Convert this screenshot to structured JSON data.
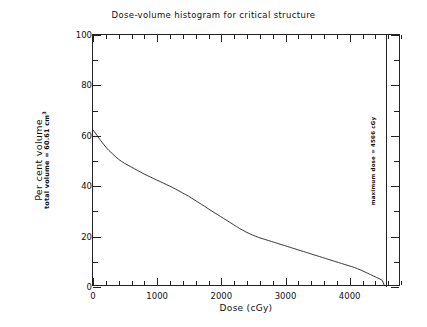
{
  "chart_data": {
    "type": "line",
    "title": "Dose-volume histogram for critical structure",
    "xlabel": "Dose (cGy)",
    "ylabel": "Per cent volume",
    "ylabel_sub": "total volume =  60.61 cm",
    "ylabel_sub_exp": "3",
    "xlim": [
      0,
      4800
    ],
    "ylim": [
      0,
      100
    ],
    "xticks": [
      0,
      1000,
      2000,
      3000,
      4000
    ],
    "xtick_labels": [
      "0",
      "1000",
      "2000",
      "3000",
      "4000"
    ],
    "xtick_minor_step": 200,
    "yticks": [
      0,
      20,
      40,
      60,
      80,
      100
    ],
    "ytick_labels": [
      "0",
      "20",
      "40",
      "60",
      "80",
      "100"
    ],
    "ytick_minor_step": 10,
    "grid": false,
    "legend": "none",
    "line_color": "#222222",
    "annotations": [
      {
        "name": "maximum-dose-line",
        "text": "maximum dose =  4566 cGy",
        "x": 4566,
        "orientation": "vertical"
      }
    ],
    "x": [
      0,
      50,
      100,
      150,
      200,
      250,
      300,
      350,
      400,
      450,
      500,
      550,
      600,
      650,
      700,
      750,
      800,
      850,
      900,
      950,
      1000,
      1050,
      1100,
      1150,
      1200,
      1250,
      1300,
      1350,
      1400,
      1450,
      1500,
      1550,
      1600,
      1650,
      1700,
      1750,
      1800,
      1850,
      1900,
      1950,
      2000,
      2050,
      2100,
      2150,
      2200,
      2250,
      2300,
      2350,
      2400,
      2450,
      2500,
      2550,
      2600,
      2650,
      2700,
      2750,
      2800,
      2850,
      2900,
      2950,
      3000,
      3050,
      3100,
      3150,
      3200,
      3250,
      3300,
      3350,
      3400,
      3450,
      3500,
      3550,
      3600,
      3650,
      3700,
      3750,
      3800,
      3850,
      3900,
      3950,
      4000,
      4050,
      4100,
      4150,
      4200,
      4250,
      4300,
      4350,
      4400,
      4450,
      4500,
      4540,
      4566
    ],
    "y": [
      62.0,
      60.3,
      58.5,
      56.8,
      55.2,
      53.8,
      52.6,
      51.4,
      50.3,
      49.4,
      48.6,
      47.9,
      47.2,
      46.5,
      45.8,
      45.1,
      44.4,
      43.8,
      43.2,
      42.6,
      42.0,
      41.4,
      40.8,
      40.2,
      39.6,
      39.0,
      38.3,
      37.6,
      36.9,
      36.2,
      35.5,
      34.7,
      33.9,
      33.1,
      32.3,
      31.5,
      30.6,
      29.8,
      29.0,
      28.2,
      27.4,
      26.6,
      25.8,
      25.0,
      24.2,
      23.4,
      22.6,
      21.9,
      21.2,
      20.6,
      20.0,
      19.5,
      19.0,
      18.6,
      18.2,
      17.8,
      17.4,
      17.0,
      16.6,
      16.2,
      15.8,
      15.4,
      15.0,
      14.6,
      14.2,
      13.8,
      13.4,
      13.0,
      12.6,
      12.2,
      11.8,
      11.4,
      11.0,
      10.6,
      10.2,
      9.8,
      9.4,
      9.0,
      8.6,
      8.2,
      7.8,
      7.4,
      7.0,
      6.5,
      6.0,
      5.4,
      4.8,
      4.2,
      3.6,
      3.0,
      2.4,
      1.8,
      0.0
    ]
  }
}
